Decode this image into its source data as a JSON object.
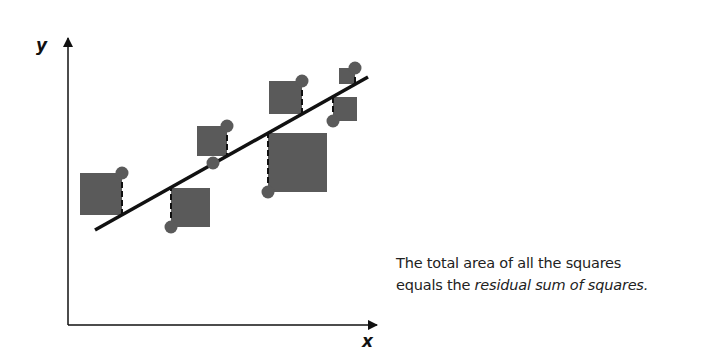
{
  "axes": {
    "x_label": "x",
    "y_label": "y"
  },
  "caption": {
    "line1": "The total area of all the squares",
    "line2_prefix": "equals the ",
    "line2_emphasis": "residual sum of squares."
  },
  "colors": {
    "square": "#5a5a5a",
    "point": "#5a5a5a",
    "line": "#111111",
    "axis": "#111111"
  },
  "chart_data": {
    "type": "scatter",
    "title": "",
    "xlabel": "x",
    "ylabel": "y",
    "grid": false,
    "regression_line": {
      "from": [
        95,
        230
      ],
      "to": [
        368,
        77
      ]
    },
    "points": [
      {
        "px": 122,
        "py": 173,
        "fit_y": 215,
        "side": "left"
      },
      {
        "px": 171,
        "py": 227,
        "fit_y": 188,
        "side": "right"
      },
      {
        "px": 213,
        "py": 163,
        "fit_y": 164,
        "side": "none"
      },
      {
        "px": 227,
        "py": 126,
        "fit_y": 156,
        "side": "left"
      },
      {
        "px": 268,
        "py": 192,
        "fit_y": 133,
        "side": "right"
      },
      {
        "px": 302,
        "py": 81,
        "fit_y": 114,
        "side": "left"
      },
      {
        "px": 333,
        "py": 121,
        "fit_y": 97,
        "side": "right"
      },
      {
        "px": 355,
        "py": 68,
        "fit_y": 84,
        "side": "left"
      }
    ],
    "annotation": "The total area of all the squares equals the residual sum of squares."
  }
}
